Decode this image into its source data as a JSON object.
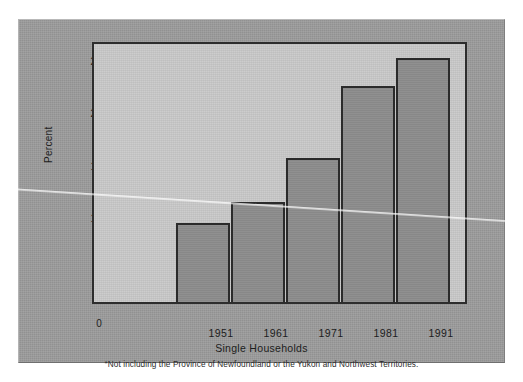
{
  "figure": {
    "ylabel": "Percent",
    "xlabel": "Single Households",
    "footnote_marker": "*",
    "footnote": "Not including the Province of Newfoundland or the Yukon and Northwest Territories.",
    "colors": {
      "page_background": "#ffffff",
      "panel_background": "#9b9b9b",
      "plot_background": "#c8c8c8",
      "bar_fill": "#8c8c8c",
      "bar_border": "#2b2b2b",
      "axis": "#2d2d2d",
      "text": "#1c1c1c",
      "crease": "#ffffff"
    }
  },
  "chart_data": {
    "type": "bar",
    "title": "",
    "subtitle": "",
    "xlabel": "Single Households",
    "ylabel": "Percent",
    "categories": [
      "1951",
      "1961",
      "1971",
      "1981",
      "1991"
    ],
    "values": [
      7.5,
      9.5,
      13.7,
      20.6,
      23.3
    ],
    "series": [
      {
        "name": "Single Households",
        "values": [
          7.5,
          9.5,
          13.7,
          20.6,
          23.3
        ]
      }
    ],
    "ylim": [
      0,
      25
    ],
    "yticks": [
      0,
      5,
      10,
      15,
      20,
      25
    ],
    "ytick_labels": [
      "0",
      "5",
      "10",
      "15",
      "20",
      "25"
    ],
    "grid": false,
    "legend": null,
    "legend_position": "none",
    "annotations": [
      "*Not including the Province of Newfoundland or the Yukon and Northwest Territories."
    ]
  }
}
